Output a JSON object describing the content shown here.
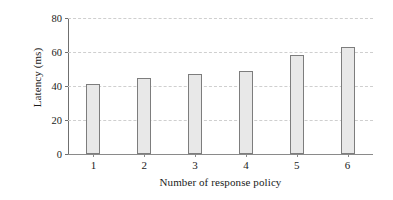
{
  "chart_data": {
    "type": "bar",
    "title": "",
    "subtitle": "",
    "xlabel": "Number of response policy",
    "ylabel": "Latency (ms)",
    "categories": [
      "1",
      "2",
      "3",
      "4",
      "5",
      "6"
    ],
    "values": [
      41,
      45,
      47,
      49,
      58,
      63
    ],
    "series": [
      {
        "name": "Latency",
        "values": [
          41,
          45,
          47,
          49,
          58,
          63
        ]
      }
    ],
    "ylim": [
      0,
      80
    ],
    "yticks": [
      0,
      20,
      40,
      60,
      80
    ],
    "ytick_labels": [
      "0",
      "20",
      "40",
      "60",
      "80"
    ],
    "xtick_labels": [
      "1",
      "2",
      "3",
      "4",
      "5",
      "6"
    ],
    "grid": "horizontal-dashed",
    "legend": "none",
    "annotations": [],
    "colors": {
      "bar_fill": "#e8e8e8",
      "bar_edge": "#7d7d7d",
      "gridline": "#cfcfcf",
      "axis": "#6f6f6f",
      "text": "#1a1a1a",
      "background": "#ffffff"
    }
  }
}
